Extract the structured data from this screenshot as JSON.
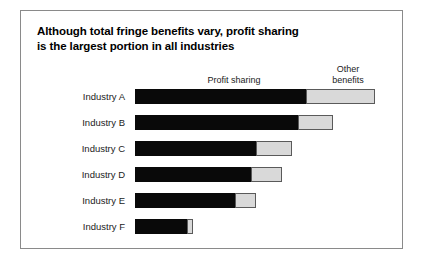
{
  "chart_data": {
    "type": "bar",
    "orientation": "horizontal",
    "stacked": true,
    "title": "Although total fringe benefits vary, profit sharing is the largest portion in all industries",
    "title_lines": [
      "Although total fringe benefits vary, profit sharing",
      "is the largest portion in all industries"
    ],
    "categories": [
      "Industry A",
      "Industry B",
      "Industry C",
      "Industry D",
      "Industry E",
      "Industry F"
    ],
    "series": [
      {
        "name": "Profit sharing",
        "color": "#090909",
        "values": [
          164,
          156,
          116,
          111,
          96,
          50
        ]
      },
      {
        "name": "Other benefits",
        "color": "#d9d9d9",
        "values": [
          66,
          34,
          35,
          30,
          20,
          6
        ]
      }
    ],
    "totals": [
      230,
      190,
      151,
      141,
      116,
      56
    ],
    "xlabel": "",
    "ylabel": "",
    "xlim": [
      0,
      240
    ],
    "grid": false,
    "axis_visible": false,
    "legend_position": "top",
    "legend": [
      {
        "label": "Profit sharing",
        "lines": [
          "Profit sharing"
        ]
      },
      {
        "label": "Other benefits",
        "lines": [
          "Other",
          "benefits"
        ]
      }
    ]
  },
  "frame": {
    "border_color": "#8a8a8a",
    "background": "#ffffff"
  }
}
